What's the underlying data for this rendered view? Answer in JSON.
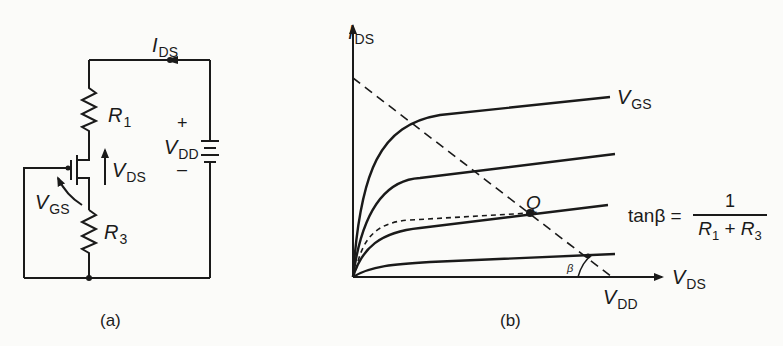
{
  "figure_a": {
    "caption": "(a)",
    "labels": {
      "ids_main": "I",
      "ids_sub": "DS",
      "r1_main": "R",
      "r1_sub": "1",
      "r3_main": "R",
      "r3_sub": "3",
      "vds_main": "V",
      "vds_sub": "DS",
      "vgs_main": "V",
      "vgs_sub": "GS",
      "vdd_main": "V",
      "vdd_sub": "DD",
      "plus": "+",
      "minus": "–"
    }
  },
  "figure_b": {
    "caption": "(b)",
    "labels": {
      "y_axis_main": "I",
      "y_axis_sub": "DS",
      "x_axis_main": "V",
      "x_axis_sub": "DS",
      "top_curve_main": "V",
      "top_curve_sub": "GS",
      "vdd_main": "V",
      "vdd_sub": "DD",
      "q_point": "Q",
      "beta": "β",
      "tan_lhs": "tanβ =",
      "tan_num": "1",
      "tan_den_r1": "R",
      "tan_den_r1_sub": "1",
      "tan_den_plus": " + ",
      "tan_den_r3": "R",
      "tan_den_r3_sub": "3"
    }
  },
  "colors": {
    "ink": "#1a1a1a",
    "paper": "#fbfbf9"
  }
}
